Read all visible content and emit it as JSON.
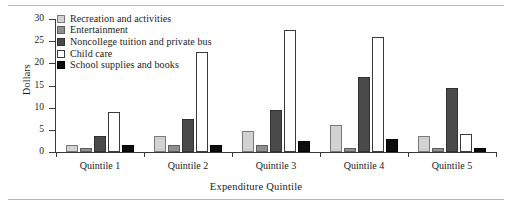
{
  "chart_data": {
    "type": "bar",
    "title": "",
    "xlabel": "Expenditure Quintile",
    "ylabel": "Dollars",
    "ylim": [
      0,
      30
    ],
    "yticks": [
      0,
      5,
      10,
      15,
      20,
      25,
      30
    ],
    "grid": false,
    "legend_position": "top-left",
    "categories": [
      "Quintile 1",
      "Quintile 2",
      "Quintile 3",
      "Quintile 4",
      "Quintile 5"
    ],
    "series": [
      {
        "name": "Recreation and activities",
        "color": "#d2d2d2",
        "values": [
          1.5,
          3.5,
          4.7,
          6.0,
          3.5
        ]
      },
      {
        "name": "Entertainment",
        "color": "#8f8f8f",
        "values": [
          1.0,
          1.5,
          1.5,
          1.0,
          1.0
        ]
      },
      {
        "name": "Noncollege tuition and private bus",
        "color": "#4a4a4a",
        "values": [
          3.5,
          7.5,
          9.5,
          17.0,
          14.5
        ]
      },
      {
        "name": "Child care",
        "color": "#ffffff",
        "values": [
          9.0,
          22.5,
          27.5,
          26.0,
          4.0
        ]
      },
      {
        "name": "School supplies and books",
        "color": "#0d0d0d",
        "values": [
          1.5,
          1.5,
          2.5,
          3.0,
          1.0
        ]
      }
    ]
  },
  "axis": {
    "y_title": "Dollars",
    "x_title": "Expenditure Quintile",
    "y_tick_labels": [
      "0",
      "5",
      "10",
      "15",
      "20",
      "25",
      "30"
    ]
  },
  "legend": {
    "items": [
      {
        "label": "Recreation and activities",
        "swatch": "swatch-light-gray"
      },
      {
        "label": "Entertainment",
        "swatch": "swatch-medium-gray"
      },
      {
        "label": "Noncollege tuition and private bus",
        "swatch": "swatch-dark-gray"
      },
      {
        "label": "Child care",
        "swatch": "swatch-white"
      },
      {
        "label": "School supplies and books",
        "swatch": "swatch-black"
      }
    ]
  }
}
